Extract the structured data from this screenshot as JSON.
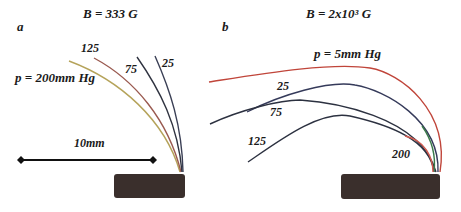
{
  "panel_a": {
    "letter": "a",
    "field_label": "B = 333 G",
    "pressure_label": "p = 200mm Hg",
    "curve_labels": [
      "125",
      "75",
      "25"
    ],
    "scale_bar_label": "10mm",
    "curves": [
      {
        "pressure": "200",
        "color": "#b5a35a"
      },
      {
        "pressure": "125",
        "color": "#9a5a50"
      },
      {
        "pressure": "75",
        "color": "#2f3340"
      },
      {
        "pressure": "25",
        "color": "#3a3f55"
      }
    ]
  },
  "panel_b": {
    "letter": "b",
    "field_label": "B = 2x10³ G",
    "pressure_label": "p = 5mm Hg",
    "curve_labels": [
      "25",
      "75",
      "125",
      "200"
    ],
    "curves": [
      {
        "pressure": "5",
        "color": "#c0453a"
      },
      {
        "pressure": "25",
        "color": "#353a5a"
      },
      {
        "pressure": "75",
        "color": "#2c3140"
      },
      {
        "pressure": "125",
        "color": "#3a7a4a"
      },
      {
        "pressure": "200",
        "color": "#d05a50"
      }
    ]
  },
  "colors": {
    "electrode": "#3a2f2c",
    "text": "#1a1a1a"
  }
}
